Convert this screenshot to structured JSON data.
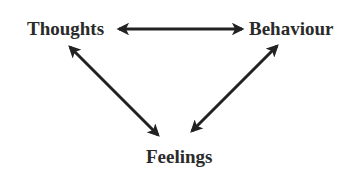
{
  "diagram": {
    "type": "triangle-cycle",
    "nodes": [
      {
        "id": "thoughts",
        "label": "Thoughts"
      },
      {
        "id": "behaviour",
        "label": "Behaviour"
      },
      {
        "id": "feelings",
        "label": "Feelings"
      }
    ],
    "edges": [
      {
        "from": "thoughts",
        "to": "behaviour",
        "direction": "bidirectional"
      },
      {
        "from": "thoughts",
        "to": "feelings",
        "direction": "bidirectional"
      },
      {
        "from": "behaviour",
        "to": "feelings",
        "direction": "bidirectional"
      }
    ],
    "colors": {
      "text": "#2a2a2a",
      "arrow": "#222222",
      "background": "#ffffff"
    }
  }
}
